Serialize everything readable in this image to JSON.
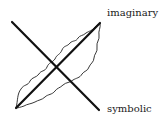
{
  "diagram": {
    "labels": {
      "imaginary": "imaginary",
      "symbolic": "symbolic"
    },
    "colors": {
      "line": "#111111",
      "outline": "#222222",
      "background": "#ffffff"
    },
    "elements": [
      {
        "type": "line",
        "name": "symbolic-axis",
        "from": [
          12,
          22
        ],
        "to": [
          99,
          110
        ],
        "label": "symbolic"
      },
      {
        "type": "line",
        "name": "imaginary-axis",
        "from": [
          16,
          108
        ],
        "to": [
          100,
          23
        ],
        "label": "imaginary"
      },
      {
        "type": "wavy-outline",
        "name": "leaf-shape",
        "around": "imaginary-axis"
      }
    ]
  }
}
